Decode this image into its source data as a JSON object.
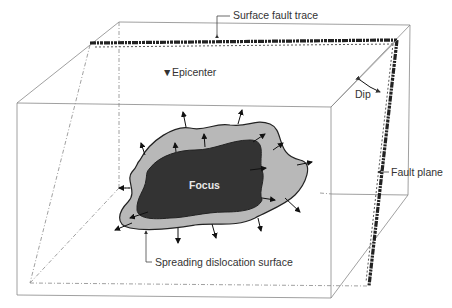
{
  "diagram": {
    "type": "block-diagram",
    "labels": {
      "surface_fault_trace": "Surface fault trace",
      "epicenter": "Epicenter",
      "dip": "Dip",
      "fault_plane": "Fault plane",
      "focus": "Focus",
      "spreading_dislocation_surface": "Spreading dislocation surface"
    },
    "symbols": {
      "epicenter_marker": "▼"
    },
    "colors": {
      "focus_fill": "#333333",
      "dislocation_fill": "#b8b8b8",
      "outline": "#222222",
      "box_edges": "#888888",
      "fault_trace": "#222222"
    }
  }
}
